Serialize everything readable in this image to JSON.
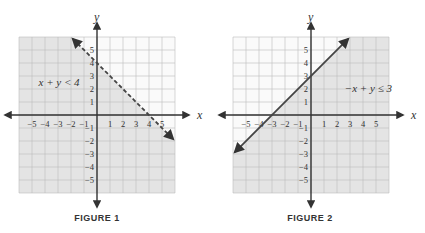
{
  "chart_data": [
    {
      "type": "inequality-graph",
      "title": "FIGURE 1",
      "inequality": "x + y < 4",
      "boundary": {
        "slope": -1,
        "intercept": 4,
        "style": "dashed"
      },
      "shaded": "below",
      "xlabel": "x",
      "ylabel": "y",
      "xlim": [
        -6,
        6
      ],
      "ylim": [
        -6,
        6
      ],
      "xticks": [
        -5,
        -4,
        -3,
        -2,
        -1,
        1,
        2,
        3,
        4,
        5
      ],
      "yticks": [
        -5,
        -4,
        -3,
        -2,
        -1,
        1,
        2,
        3,
        4,
        5
      ],
      "grid": true,
      "label_pos": [
        -4.5,
        2.2
      ]
    },
    {
      "type": "inequality-graph",
      "title": "FIGURE 2",
      "inequality": "−x + y ≤ 3",
      "boundary": {
        "slope": 1,
        "intercept": 3,
        "style": "solid"
      },
      "shaded": "below",
      "xlabel": "x",
      "ylabel": "y",
      "xlim": [
        -6,
        6
      ],
      "ylim": [
        -6,
        6
      ],
      "xticks": [
        -5,
        -4,
        -3,
        -2,
        -1,
        1,
        2,
        3,
        4,
        5
      ],
      "yticks": [
        -5,
        -4,
        -3,
        -2,
        -1,
        1,
        2,
        3,
        4,
        5
      ],
      "grid": true,
      "label_pos": [
        2.6,
        1.8
      ]
    }
  ],
  "figures": [
    {
      "caption": "FIGURE 1",
      "origin_x": 97,
      "origin_y": 115,
      "unit": 13
    },
    {
      "caption": "FIGURE 2",
      "origin_x": 311,
      "origin_y": 115,
      "unit": 13
    }
  ],
  "colors": {
    "shade": "#e4e4e4",
    "grid": "#bdbdbd",
    "axis": "#333333",
    "line": "#444444",
    "text": "#333333"
  }
}
